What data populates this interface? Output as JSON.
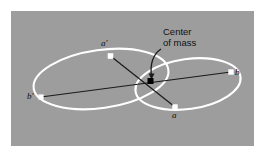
{
  "figure": {
    "type": "physics-diagram",
    "background_color": "#ffffff",
    "panel_color": "#9d9d9d",
    "orbit_color": "#ffffff",
    "line_color": "#1a1a1a",
    "marker_color": "#ffffff",
    "center_marker_color": "#000000",
    "panel": {
      "x": 11,
      "y": 11,
      "width": 243,
      "height": 135
    },
    "annotation": {
      "name": "center-of-mass-label",
      "line1": "Center",
      "line2": "of mass",
      "x": 163,
      "y": 29,
      "arrow_from": {
        "x": 160,
        "y": 50
      },
      "arrow_to": {
        "x": 152,
        "y": 78
      },
      "arrow_ctrl": {
        "x": 150,
        "y": 58
      }
    },
    "center_of_mass": {
      "name": "center-of-mass-point",
      "x": 150.5,
      "y": 81
    },
    "orbits": [
      {
        "name": "orbit-large-left",
        "cx": 101,
        "cy": 79,
        "rx": 68,
        "ry": 29,
        "rotation": -8
      },
      {
        "name": "orbit-small-right",
        "cx": 188,
        "cy": 84,
        "rx": 53,
        "ry": 25,
        "rotation": -8
      }
    ],
    "axes": [
      {
        "name": "axis-bprime-b",
        "x1": 41,
        "y1": 97,
        "x2": 231,
        "y2": 72
      },
      {
        "name": "axis-aprime-a",
        "x1": 110.5,
        "y1": 56,
        "x2": 175,
        "y2": 107
      }
    ],
    "points": [
      {
        "name": "point-a-prime",
        "label": "a′",
        "x": 110.5,
        "y": 56,
        "label_x": 101,
        "label_y": 42
      },
      {
        "name": "point-b-prime",
        "label": "b′",
        "x": 41,
        "y": 97,
        "label_x": 28,
        "label_y": 96
      },
      {
        "name": "point-b",
        "label": "b",
        "x": 231,
        "y": 72,
        "label_x": 234,
        "label_y": 72
      },
      {
        "name": "point-a",
        "label": "a",
        "x": 175,
        "y": 107,
        "label_x": 172,
        "label_y": 112
      }
    ]
  }
}
